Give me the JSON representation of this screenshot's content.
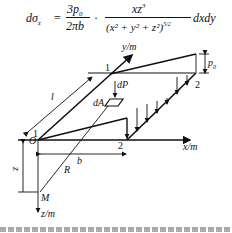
{
  "formula": {
    "lhs": "dσ",
    "lhs_sub": "z",
    "eq": "=",
    "frac1_num": "3p",
    "frac1_num_sub": "0",
    "frac1_den": "2πb",
    "dot": "·",
    "frac2_num": "xz",
    "frac2_num_sup": "3",
    "frac2_den": "(x² + y² + z²)",
    "frac2_den_exp": "5/2",
    "tail": "dxdy"
  },
  "labels": {
    "y_axis": "y/m",
    "x_axis": "x/m",
    "z_axis": "z/m",
    "origin": "O",
    "point_m": "M",
    "r": "R",
    "b": "b",
    "z_dim": "z",
    "l_dim": "l",
    "dP": "dP",
    "dA": "dA",
    "p0": "p",
    "p0_sub": "0",
    "corner_1_top": "1",
    "corner_1_left": "1",
    "corner_2_right": "2",
    "corner_2_bottom": "2"
  },
  "caption": "（cut-off text line）",
  "colors": {
    "line": "#111111",
    "background": "#ffffff"
  }
}
